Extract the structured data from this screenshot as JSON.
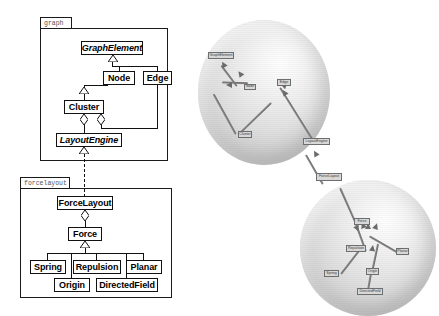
{
  "figure": {
    "kind": "uml-class-diagram-with-3d-graph-layout",
    "background": "#ffffff",
    "line_color": "#111111",
    "node_fill": "#d8d8d8",
    "sphere_tint": "#dcdcdc"
  },
  "packages": [
    {
      "name": "graph",
      "tab_label": "graph",
      "classes": [
        {
          "name": "GraphElement",
          "abstract": true
        },
        {
          "name": "Node",
          "abstract": false
        },
        {
          "name": "Edge",
          "abstract": false
        },
        {
          "name": "Cluster",
          "abstract": false
        },
        {
          "name": "LayoutEngine",
          "abstract": true
        }
      ],
      "relations": [
        {
          "type": "generalization",
          "from": "Node",
          "to": "GraphElement"
        },
        {
          "type": "generalization",
          "from": "Edge",
          "to": "GraphElement"
        },
        {
          "type": "generalization",
          "from": "Cluster",
          "to": "Node"
        },
        {
          "type": "aggregation",
          "from": "Cluster",
          "to": "LayoutEngine"
        },
        {
          "type": "aggregation",
          "from": "Edge",
          "to": "LayoutEngine"
        }
      ]
    },
    {
      "name": "forcelayout",
      "tab_label": "forcelayout",
      "classes": [
        {
          "name": "ForceLayout",
          "abstract": false
        },
        {
          "name": "Force",
          "abstract": false
        },
        {
          "name": "Spring",
          "abstract": false
        },
        {
          "name": "Repulsion",
          "abstract": false
        },
        {
          "name": "Planar",
          "abstract": false
        },
        {
          "name": "Origin",
          "abstract": false
        },
        {
          "name": "DirectedField",
          "abstract": false
        }
      ],
      "relations": [
        {
          "type": "aggregation",
          "from": "ForceLayout",
          "to": "Force"
        },
        {
          "type": "generalization",
          "from": "Spring",
          "to": "Force"
        },
        {
          "type": "generalization",
          "from": "Repulsion",
          "to": "Force"
        },
        {
          "type": "generalization",
          "from": "Planar",
          "to": "Force"
        },
        {
          "type": "generalization",
          "from": "Origin",
          "to": "Force"
        },
        {
          "type": "generalization",
          "from": "DirectedField",
          "to": "Force"
        }
      ]
    }
  ],
  "cross_package_relation": {
    "type": "realization",
    "style": "dashed",
    "from": "ForceLayout",
    "to": "LayoutEngine"
  },
  "spheres": [
    {
      "id": "sphere-graph",
      "label": "graph package sphere",
      "nodes": [
        {
          "id": "g1",
          "label": "GraphElement"
        },
        {
          "id": "g2",
          "label": "Edge"
        },
        {
          "id": "g3",
          "label": "Node"
        },
        {
          "id": "g4",
          "label": "Cluster"
        },
        {
          "id": "g5",
          "label": "LayoutEngine"
        }
      ],
      "edges": [
        {
          "from": "g2",
          "to": "g1"
        },
        {
          "from": "g3",
          "to": "g1"
        },
        {
          "from": "g3",
          "to": "g4"
        },
        {
          "from": "g4",
          "to": "g2"
        },
        {
          "from": "g5",
          "to": "g4"
        }
      ]
    },
    {
      "id": "sphere-forcelayout",
      "label": "forcelayout package sphere",
      "nodes": [
        {
          "id": "f0",
          "label": "ForceLayout"
        },
        {
          "id": "f1",
          "label": "Force"
        },
        {
          "id": "f2",
          "label": "Repulsion"
        },
        {
          "id": "f3",
          "label": "Spring"
        },
        {
          "id": "f4",
          "label": "Planar"
        },
        {
          "id": "f5",
          "label": "Origin"
        },
        {
          "id": "f6",
          "label": "DirectedField"
        }
      ],
      "edges": [
        {
          "from": "f1",
          "to": "f0"
        },
        {
          "from": "f2",
          "to": "f1"
        },
        {
          "from": "f3",
          "to": "f2"
        },
        {
          "from": "f4",
          "to": "f1"
        },
        {
          "from": "f5",
          "to": "f1"
        },
        {
          "from": "f6",
          "to": "f5"
        }
      ]
    }
  ],
  "inter_sphere_edge": {
    "from": "f0",
    "to": "g5"
  }
}
